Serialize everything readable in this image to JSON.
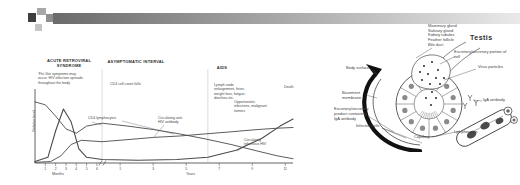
{
  "header_bar": {
    "colors": {
      "square_dark": "#3f3f3f",
      "square_mid1": "#a8a8a8",
      "square_mid2": "#8f8f8f",
      "square_light": "#c4c4c4",
      "bar_dark": "#6b6b6b",
      "bar_light": "#e9e9e9"
    }
  },
  "hiv_figure": {
    "phase_headers": [
      {
        "label": "ACUTE RETROVIRAL SYNDROME"
      },
      {
        "label": "ASYMPTOMATIC INTERVAL"
      },
      {
        "label": "AIDS"
      }
    ],
    "notes": {
      "acute": "'Flu'-like symptoms may occur. HIV infection spreads throughout the body",
      "asymptomatic": "CD4 cell count falls",
      "aids_symptoms": "Lymph node enlargement, fever, weight loss, fatigue, diarrhea etc.",
      "aids_complications": "Opportunistic infections, malignant tumors",
      "death": "Death"
    },
    "curve_labels": {
      "cd4": "CD4 lymphocytes",
      "antibody": "Circulating anti-HIV antibody",
      "virus": "Circulating infectious HIV"
    },
    "ylabel": "Relative level",
    "xlabels": {
      "left": "Months",
      "right": "Years"
    }
  },
  "chart_data": {
    "type": "line",
    "phases": [
      "ACUTE RETROVIRAL SYNDROME",
      "ASYMPTOMATIC INTERVAL",
      "AIDS"
    ],
    "phase_boundaries_pct": [
      26,
      67
    ],
    "x_axis": {
      "left_unit": "Months",
      "left_ticks": [
        "1",
        "2",
        "3",
        "4",
        "5",
        "6"
      ],
      "axis_break": true,
      "right_unit": "Years",
      "right_ticks": [
        "1",
        "3",
        "5",
        "7",
        "9",
        "11"
      ]
    },
    "y_axis": {
      "label": "Relative level",
      "scale": "relative (unlabeled)"
    },
    "series": [
      {
        "name": "Circulating infectious HIV",
        "points_pct": [
          [
            0,
            2
          ],
          [
            5,
            8
          ],
          [
            8,
            45
          ],
          [
            11,
            76
          ],
          [
            14,
            58
          ],
          [
            17,
            20
          ],
          [
            20,
            8
          ],
          [
            26,
            5
          ],
          [
            40,
            4
          ],
          [
            55,
            5
          ],
          [
            67,
            8
          ],
          [
            78,
            18
          ],
          [
            88,
            35
          ],
          [
            95,
            52
          ],
          [
            100,
            62
          ]
        ]
      },
      {
        "name": "CD4 lymphocytes",
        "points_pct": [
          [
            0,
            86
          ],
          [
            4,
            82
          ],
          [
            8,
            66
          ],
          [
            12,
            48
          ],
          [
            16,
            42
          ],
          [
            20,
            52
          ],
          [
            26,
            56
          ],
          [
            36,
            52
          ],
          [
            46,
            47
          ],
          [
            56,
            41
          ],
          [
            66,
            34
          ],
          [
            76,
            26
          ],
          [
            86,
            17
          ],
          [
            94,
            10
          ],
          [
            100,
            6
          ]
        ]
      },
      {
        "name": "Circulating anti-HIV antibody",
        "points_pct": [
          [
            0,
            1
          ],
          [
            6,
            2
          ],
          [
            10,
            10
          ],
          [
            14,
            26
          ],
          [
            18,
            32
          ],
          [
            26,
            30
          ],
          [
            36,
            33
          ],
          [
            46,
            36
          ],
          [
            56,
            38
          ],
          [
            66,
            41
          ],
          [
            76,
            44
          ],
          [
            86,
            47
          ],
          [
            94,
            49
          ],
          [
            100,
            50
          ]
        ]
      }
    ],
    "end_annotation": "Death"
  },
  "testis_figure": {
    "title": "Testis",
    "site_list": [
      "Mammary gland",
      "Salivary gland",
      "Kidney tubules",
      "Feather follicle",
      "Bile duct"
    ],
    "labels": {
      "excretory_portion": "Excretory/secretory portion of cell",
      "virus_particles": "Virus particles",
      "iga_antibody": "IgA antibody",
      "body_surface": "Body surface",
      "basement_membrane": "Basement membrane",
      "excretory_product": "Excretory/secretory product containing IgA antibody",
      "infected_cells": "Infected cells",
      "capillary": "Capillary",
      "lymphocytes": "Lymphocytes"
    }
  }
}
